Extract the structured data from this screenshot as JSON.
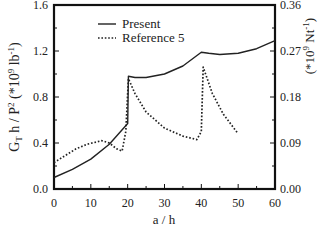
{
  "chart_data": {
    "type": "line",
    "title": "",
    "xlabel": "a / h",
    "ylabel": "G_T h / P^2 (*10^9 lb^-1)",
    "ylabel_right": "(*10^9 Nt^-1)",
    "xlim": [
      0,
      60
    ],
    "ylim": [
      0.0,
      1.6
    ],
    "ylim_right": [
      0.0,
      0.36
    ],
    "xticks": [
      "0",
      "10",
      "20",
      "30",
      "40",
      "50",
      "60"
    ],
    "yticks": [
      "0.0",
      "0.4",
      "0.8",
      "1.2",
      "1.6"
    ],
    "yticks_right": [
      "0.00",
      "0.09",
      "0.18",
      "0.27",
      "0.36"
    ],
    "grid": false,
    "legend_position": "upper-left-inside",
    "series": [
      {
        "name": "Present",
        "style": "solid",
        "x": [
          0,
          5,
          10,
          15,
          20,
          20.2,
          22,
          25,
          30,
          35,
          40,
          42,
          45,
          50,
          55,
          60
        ],
        "y": [
          0.1,
          0.17,
          0.26,
          0.39,
          0.57,
          0.98,
          0.97,
          0.97,
          1.0,
          1.07,
          1.19,
          1.18,
          1.17,
          1.18,
          1.22,
          1.29
        ]
      },
      {
        "name": "Reference 5",
        "style": "dotted",
        "x": [
          0,
          3,
          6,
          9,
          13,
          15,
          17,
          18.5,
          19.5,
          20.2,
          22,
          25,
          30,
          35,
          38.8,
          40,
          40.5,
          43,
          46,
          50
        ],
        "y": [
          0.23,
          0.29,
          0.35,
          0.39,
          0.42,
          0.4,
          0.35,
          0.33,
          0.5,
          0.96,
          0.83,
          0.67,
          0.53,
          0.46,
          0.43,
          0.5,
          1.06,
          0.83,
          0.65,
          0.48
        ]
      }
    ]
  },
  "legend": {
    "items": [
      {
        "label": "Present",
        "style": "solid"
      },
      {
        "label": "Reference 5",
        "style": "dotted"
      }
    ]
  },
  "axes": {
    "x_title": "a / h",
    "y_title_main": "G",
    "y_title_sub": "T",
    "y_title_rest": " h / P",
    "y_title_sup": "2",
    "y_title_unit": " (*10",
    "y_title_unit_sup": "9",
    "y_title_unit_rest": " lb",
    "y_title_unit_sup2": "-1",
    "y_title_close": ")",
    "y2_title_open": "(*10",
    "y2_title_sup": "9",
    "y2_title_rest": " Nt",
    "y2_title_sup2": "-1",
    "y2_title_close": ")"
  }
}
